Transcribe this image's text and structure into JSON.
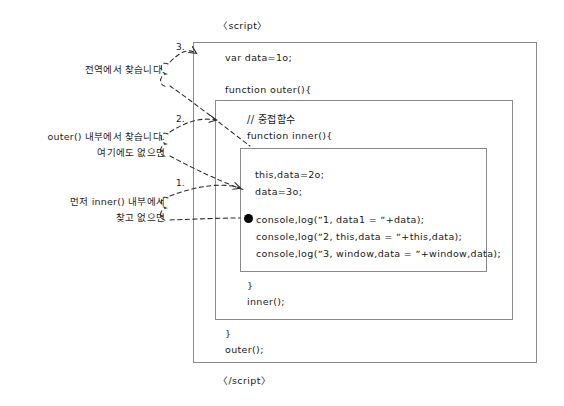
{
  "diagram": {
    "script_open_tag": "〈script〉",
    "script_close_tag": "〈/script〉",
    "boxes": {
      "script_scope_label": "script",
      "outer_scope_label": "outer",
      "inner_scope_label": "inner"
    }
  },
  "code": {
    "global_var": "var data=1o;",
    "outer_decl": "function outer(){",
    "nested_comment": "// 중접함수",
    "inner_decl": "function inner(){",
    "this_assign": "this,data=2o;",
    "data_assign": "data=3o;",
    "log1": "console,log(ˮ1, data1 = ˮ+data);",
    "log2": "console,log(ˮ2, this,data = ˮ+this,data);",
    "log3": "console,log(ˮ3, window,data = ˮ+window,data);",
    "inner_close_brace": "}",
    "inner_call": "inner();",
    "outer_close_brace": "}",
    "outer_call": "outer();"
  },
  "annotations": [
    {
      "number": "1.",
      "line1": "먼저 inner() 내부에서",
      "line2": "찾고 없으면"
    },
    {
      "number": "2.",
      "line1": "outer() 내부에서 찾습니다.",
      "line2": "여기에도 없으면"
    },
    {
      "number": "3.",
      "line1": "전역에서 찾습니다.",
      "line2": ""
    }
  ],
  "marker": {
    "execution_point": "●"
  },
  "colors": {
    "background": "#ffffff",
    "ink": "#191919",
    "box_border": "#8a8a8a",
    "connector": "#2b2b2b"
  }
}
